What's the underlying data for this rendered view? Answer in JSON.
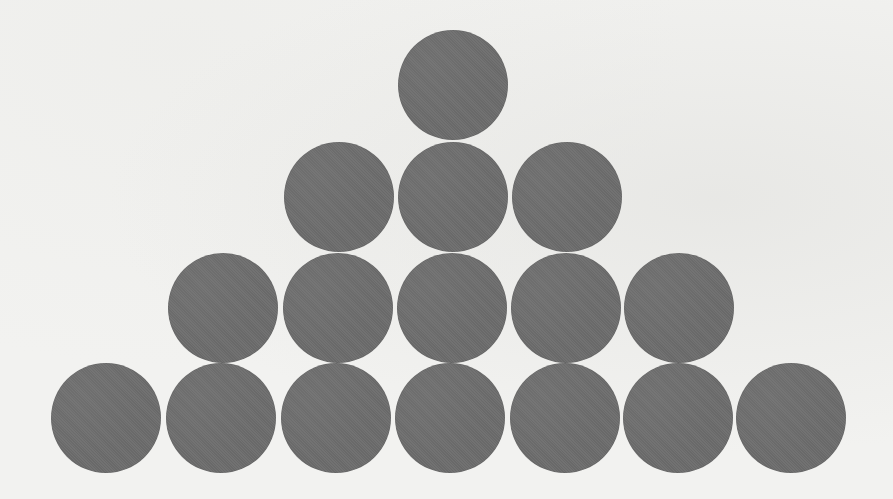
{
  "figure": {
    "background_color": "#f2f2f0",
    "circle_color": "#6d6d6d",
    "circle_diameter": 110,
    "total_circles": 16,
    "rows": [
      {
        "count": 1,
        "cy": 85,
        "cx": [
          453
        ]
      },
      {
        "count": 3,
        "cy": 197,
        "cx": [
          339,
          453,
          567
        ]
      },
      {
        "count": 5,
        "cy": 308,
        "cx": [
          223,
          338,
          452,
          566,
          679
        ]
      },
      {
        "count": 7,
        "cy": 418,
        "cx": [
          106,
          221,
          336,
          450,
          565,
          678,
          791
        ]
      }
    ]
  }
}
